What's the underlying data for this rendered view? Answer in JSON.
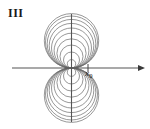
{
  "figure": {
    "label": "III",
    "caption_label": "III",
    "background_color": "#ffffff",
    "stroke_color": "#6b6b6b",
    "axis_color": "#555555",
    "text_color": "#1a1a1a",
    "width": 150,
    "height": 129
  },
  "axes": {
    "origin": {
      "x": 71.5,
      "y": 68
    },
    "x_axis": {
      "name": "horizontal-axis",
      "x_start": 12,
      "x_end": 141,
      "y": 68,
      "arrow_right": true,
      "arrow_left": false
    },
    "y_axis": {
      "name": "vertical-axis",
      "x": 71.5,
      "y_start": 14,
      "y_end": 122,
      "arrow_top": false,
      "arrow_bottom": false
    },
    "tick": {
      "label": "x",
      "subscript": "0",
      "x": 88,
      "y": 68,
      "half_height": 4
    }
  },
  "chart_data": {
    "type": "diagram",
    "title": "III",
    "xlabel": "",
    "ylabel": "",
    "curve_family": {
      "kind": "tangent-circles-pencil",
      "tangent_point": {
        "x": 71.5,
        "y": 68
      },
      "upper_radii": [
        4.2,
        8.0,
        11.5,
        14.6,
        17.4,
        20.0,
        22.3,
        24.3,
        26.0,
        27.2
      ],
      "lower_radii": [
        4.2,
        8.0,
        11.5,
        14.6,
        17.4,
        20.0,
        22.3,
        24.3,
        26.0,
        27.2
      ],
      "upper_count": 10,
      "lower_count": 10,
      "max_radius": 27.2,
      "extent": {
        "left": 44.3,
        "right": 98.7,
        "top": 13.6,
        "bottom": 122.4
      }
    },
    "annotations": [
      {
        "text": "III",
        "x": 8,
        "y": 7,
        "role": "figure-label"
      },
      {
        "text": "x0",
        "x": 85,
        "y": 69,
        "role": "axis-tick-label"
      }
    ],
    "grid": false,
    "legend": null
  }
}
